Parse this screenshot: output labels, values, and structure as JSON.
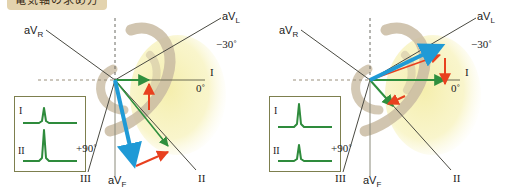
{
  "title": "電気軸の求め方",
  "colors": {
    "resultant_vector": "#1f9ad6",
    "component_vector": "#2f8f3e",
    "projection_vector": "#e8401f",
    "axis_line": "#4a4a42",
    "heart_silhouette": "#c9bba2",
    "highlight_wedge": "#f7f2bb",
    "ecg_trace": "#2e8b3c",
    "inset_border": "#7d7f4e",
    "title_badge": "#e3d3ae"
  },
  "panels": [
    {
      "id": "left",
      "name": "right-axis-deviation",
      "axes": [
        {
          "label": "aVR",
          "lead": "aV",
          "sub": "R"
        },
        {
          "label": "aVL",
          "lead": "aV",
          "sub": "L"
        },
        {
          "label": "aVF",
          "lead": "aV",
          "sub": "F"
        },
        {
          "label": "I",
          "lead": "I",
          "sub": ""
        },
        {
          "label": "II",
          "lead": "II",
          "sub": ""
        },
        {
          "label": "III",
          "lead": "III",
          "sub": ""
        }
      ],
      "degree_marks": [
        {
          "value": "−30˚",
          "name": "minus-thirty-degrees"
        },
        {
          "value": "0˚",
          "name": "zero-degrees"
        },
        {
          "value": "+90˚",
          "name": "plus-ninety-degrees"
        }
      ],
      "ecg": {
        "traces": [
          {
            "lead": "I",
            "amplitude": "small"
          },
          {
            "lead": "II",
            "amplitude": "large"
          }
        ]
      },
      "vectors": {
        "resultant_direction_deg": 80,
        "lead_I_component": "small",
        "lead_II_component": "large"
      }
    },
    {
      "id": "right",
      "name": "left-axis-deviation",
      "axes": [
        {
          "label": "aVR",
          "lead": "aV",
          "sub": "R"
        },
        {
          "label": "aVL",
          "lead": "aV",
          "sub": "L"
        },
        {
          "label": "aVF",
          "lead": "aV",
          "sub": "F"
        },
        {
          "label": "I",
          "lead": "I",
          "sub": ""
        },
        {
          "label": "II",
          "lead": "II",
          "sub": ""
        },
        {
          "label": "III",
          "lead": "III",
          "sub": ""
        }
      ],
      "degree_marks": [
        {
          "value": "−30˚",
          "name": "minus-thirty-degrees"
        },
        {
          "value": "0˚",
          "name": "zero-degrees"
        },
        {
          "value": "+90˚",
          "name": "plus-ninety-degrees"
        }
      ],
      "ecg": {
        "traces": [
          {
            "lead": "I",
            "amplitude": "large"
          },
          {
            "lead": "II",
            "amplitude": "small"
          }
        ]
      },
      "vectors": {
        "resultant_direction_deg": -20,
        "lead_I_component": "large",
        "lead_II_component": "small"
      }
    }
  ]
}
